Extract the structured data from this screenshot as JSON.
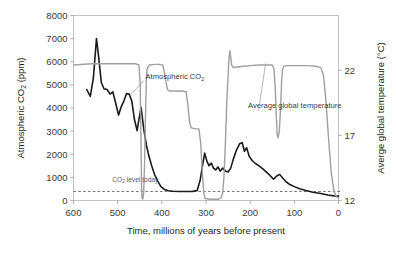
{
  "chart_data": {
    "type": "line",
    "title": "",
    "xlabel": "Time, millions of years before present",
    "ylabel": "Atmospheric CO₂ (ppm)",
    "y2label": "Averge global temperature (°C)",
    "grid": false,
    "legend_position": "inline-annotations",
    "xlim": [
      600,
      0
    ],
    "x_reversed": true,
    "xticks": [
      "600",
      "500",
      "400",
      "300",
      "200",
      "100",
      "0"
    ],
    "xtick_values": [
      600,
      500,
      400,
      300,
      200,
      100,
      0
    ],
    "ylim": [
      0,
      8000
    ],
    "yticks": [
      "0",
      "1000",
      "2000",
      "3000",
      "4000",
      "5000",
      "6000",
      "7000",
      "8000"
    ],
    "ytick_values": [
      0,
      1000,
      2000,
      3000,
      4000,
      5000,
      6000,
      7000,
      8000
    ],
    "y2lim": [
      12,
      26.2
    ],
    "y2ticks": [
      "12",
      "17",
      "22"
    ],
    "y2tick_values": [
      12,
      17,
      22
    ],
    "annotations": [
      {
        "name": "co2-series-label",
        "text": "Atmospheric CO₂",
        "x": 437,
        "y": 5250
      },
      {
        "name": "temperature-series-label",
        "text": "Average global temperature",
        "x": 205,
        "y": 4000
      },
      {
        "name": "co2-today-label",
        "text": "CO₂ level today",
        "x": 512,
        "y": 820
      }
    ],
    "reference_line": {
      "name": "co2-level-today-line",
      "label": "CO₂ level today",
      "value": 390,
      "style": "dashed",
      "color": "#5a5a5a"
    },
    "series": [
      {
        "name": "Atmospheric CO2",
        "axis": "left",
        "unit": "ppm",
        "color": "#1a1a1a",
        "width": 1.6,
        "points": [
          [
            570,
            4800
          ],
          [
            562,
            4500
          ],
          [
            555,
            5300
          ],
          [
            548,
            7000
          ],
          [
            543,
            6200
          ],
          [
            537,
            5100
          ],
          [
            531,
            4830
          ],
          [
            524,
            4800
          ],
          [
            517,
            4600
          ],
          [
            511,
            4700
          ],
          [
            505,
            4250
          ],
          [
            498,
            3700
          ],
          [
            492,
            4050
          ],
          [
            486,
            4300
          ],
          [
            480,
            4620
          ],
          [
            474,
            4600
          ],
          [
            468,
            4300
          ],
          [
            462,
            3500
          ],
          [
            456,
            3020
          ],
          [
            452,
            3500
          ],
          [
            447,
            4030
          ],
          [
            441,
            3100
          ],
          [
            435,
            2400
          ],
          [
            429,
            1900
          ],
          [
            423,
            1500
          ],
          [
            416,
            1100
          ],
          [
            409,
            830
          ],
          [
            402,
            600
          ],
          [
            394,
            480
          ],
          [
            385,
            420
          ],
          [
            375,
            400
          ],
          [
            360,
            390
          ],
          [
            345,
            390
          ],
          [
            330,
            395
          ],
          [
            320,
            430
          ],
          [
            313,
            900
          ],
          [
            308,
            1500
          ],
          [
            303,
            2050
          ],
          [
            298,
            1700
          ],
          [
            293,
            1500
          ],
          [
            288,
            1620
          ],
          [
            283,
            1400
          ],
          [
            278,
            1320
          ],
          [
            273,
            1450
          ],
          [
            268,
            1270
          ],
          [
            262,
            1400
          ],
          [
            256,
            1280
          ],
          [
            250,
            1230
          ],
          [
            244,
            1400
          ],
          [
            238,
            1800
          ],
          [
            231,
            2180
          ],
          [
            224,
            2450
          ],
          [
            218,
            2500
          ],
          [
            213,
            2130
          ],
          [
            208,
            2280
          ],
          [
            202,
            1900
          ],
          [
            195,
            1720
          ],
          [
            188,
            1600
          ],
          [
            180,
            1500
          ],
          [
            172,
            1380
          ],
          [
            163,
            1230
          ],
          [
            155,
            1080
          ],
          [
            147,
            920
          ],
          [
            140,
            1060
          ],
          [
            133,
            1130
          ],
          [
            126,
            960
          ],
          [
            118,
            800
          ],
          [
            110,
            690
          ],
          [
            100,
            600
          ],
          [
            88,
            510
          ],
          [
            74,
            430
          ],
          [
            58,
            360
          ],
          [
            40,
            300
          ],
          [
            24,
            240
          ],
          [
            10,
            200
          ],
          [
            0,
            190
          ]
        ]
      },
      {
        "name": "Average global temperature",
        "axis": "right",
        "unit": "°C",
        "color": "#a0a0a0",
        "width": 1.4,
        "points": [
          [
            600,
            22.4
          ],
          [
            560,
            22.5
          ],
          [
            520,
            22.5
          ],
          [
            480,
            22.5
          ],
          [
            460,
            22.5
          ],
          [
            452,
            22.4
          ],
          [
            449,
            21.0
          ],
          [
            447,
            16.0
          ],
          [
            446,
            13.2
          ],
          [
            445,
            12.2
          ],
          [
            443,
            12.1
          ],
          [
            441,
            12.6
          ],
          [
            439,
            15.0
          ],
          [
            437,
            18.5
          ],
          [
            435,
            21.3
          ],
          [
            433,
            22.2
          ],
          [
            428,
            22.4
          ],
          [
            415,
            22.45
          ],
          [
            405,
            22.45
          ],
          [
            398,
            22.4
          ],
          [
            394,
            21.8
          ],
          [
            390,
            21.0
          ],
          [
            387,
            20.5
          ],
          [
            383,
            20.4
          ],
          [
            370,
            20.4
          ],
          [
            355,
            20.4
          ],
          [
            345,
            20.35
          ],
          [
            341,
            19.3
          ],
          [
            337,
            18.0
          ],
          [
            334,
            17.6
          ],
          [
            325,
            17.5
          ],
          [
            316,
            17.5
          ],
          [
            312,
            16.4
          ],
          [
            308,
            14.0
          ],
          [
            305,
            12.6
          ],
          [
            302,
            12.15
          ],
          [
            290,
            12.1
          ],
          [
            280,
            12.1
          ],
          [
            272,
            12.1
          ],
          [
            266,
            12.2
          ],
          [
            262,
            12.6
          ],
          [
            259,
            14.0
          ],
          [
            256,
            16.5
          ],
          [
            253,
            19.5
          ],
          [
            250,
            21.6
          ],
          [
            248,
            22.9
          ],
          [
            246,
            23.5
          ],
          [
            244,
            23.0
          ],
          [
            242,
            22.4
          ],
          [
            238,
            22.2
          ],
          [
            230,
            22.25
          ],
          [
            215,
            22.3
          ],
          [
            200,
            22.35
          ],
          [
            180,
            22.4
          ],
          [
            160,
            22.4
          ],
          [
            150,
            22.4
          ],
          [
            146,
            22.1
          ],
          [
            143,
            20.5
          ],
          [
            141,
            18.6
          ],
          [
            139,
            17.1
          ],
          [
            137,
            16.8
          ],
          [
            134,
            17.3
          ],
          [
            131,
            19.2
          ],
          [
            129,
            21.0
          ],
          [
            127,
            22.0
          ],
          [
            124,
            22.3
          ],
          [
            118,
            22.35
          ],
          [
            105,
            22.35
          ],
          [
            90,
            22.35
          ],
          [
            70,
            22.35
          ],
          [
            50,
            22.3
          ],
          [
            40,
            22.2
          ],
          [
            34,
            21.6
          ],
          [
            28,
            19.5
          ],
          [
            22,
            16.5
          ],
          [
            16,
            14.0
          ],
          [
            10,
            12.7
          ],
          [
            5,
            12.3
          ],
          [
            0,
            12.2
          ]
        ]
      }
    ]
  },
  "meta": {
    "axis_title_left": "Atmospheric CO₂ (ppm)",
    "axis_title_right": "Averge global temperature (°C)",
    "axis_title_bottom": "Time, millions of years before present"
  }
}
